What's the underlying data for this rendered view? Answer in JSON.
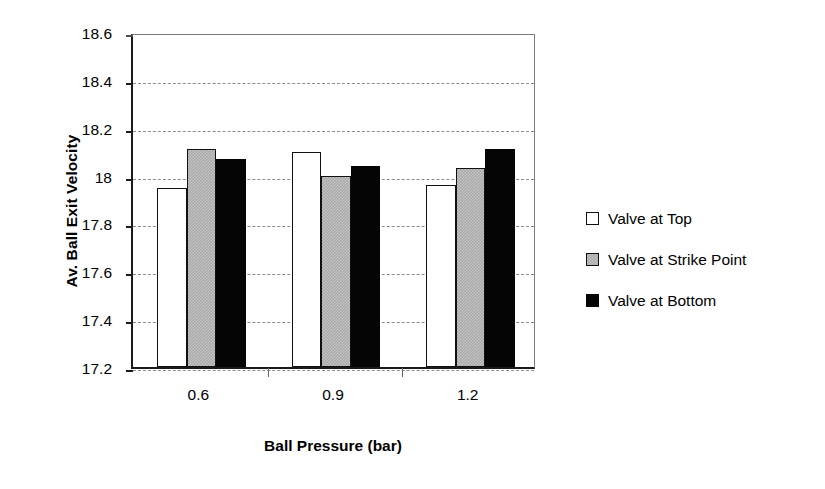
{
  "chart_data": {
    "type": "bar",
    "title": "",
    "xlabel": "Ball Pressure (bar)",
    "ylabel": "Av. Ball Exit Velocity",
    "categories": [
      "0.6",
      "0.9",
      "1.2"
    ],
    "series": [
      {
        "name": "Valve at Top",
        "values": [
          17.95,
          18.1,
          17.96
        ]
      },
      {
        "name": "Valve at Strike Point",
        "values": [
          18.11,
          18.0,
          18.03
        ]
      },
      {
        "name": "Valve at Bottom",
        "values": [
          18.07,
          18.04,
          18.11
        ]
      }
    ],
    "ylim": [
      17.2,
      18.6
    ],
    "ytick_labels": [
      "18.6",
      "18.4",
      "18.2",
      "18",
      "17.8",
      "17.6",
      "17.4",
      "17.2"
    ],
    "ytick_values": [
      18.6,
      18.4,
      18.2,
      18.0,
      17.8,
      17.6,
      17.4,
      17.2
    ],
    "grid": "horizontal-dashed",
    "legend_position": "right",
    "colors": {
      "series_0_fill": "#ffffff",
      "series_1_fill": "#a9a9a9",
      "series_2_fill": "#050505",
      "bar_outline": "#111111",
      "axis": "#1a1a1a",
      "gridline": "#8d8d8d",
      "background": "#ffffff",
      "text": "#000000"
    }
  },
  "legend": {
    "items": [
      {
        "label": "Valve at Top"
      },
      {
        "label": "Valve at Strike Point"
      },
      {
        "label": "Valve at Bottom"
      }
    ]
  }
}
